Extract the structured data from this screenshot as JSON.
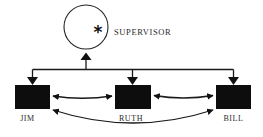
{
  "diagram": {
    "type": "organizational-communication-diagram",
    "supervisor": {
      "label": "SUPERVISOR",
      "symbol": "*",
      "shape": "circle"
    },
    "members": [
      {
        "id": "jim",
        "label": "JIM",
        "shape": "filled-square"
      },
      {
        "id": "ruth",
        "label": "RUTH",
        "shape": "filled-square"
      },
      {
        "id": "bill",
        "label": "BILL",
        "shape": "filled-square"
      }
    ],
    "connections": [
      {
        "from": "members",
        "to": "supervisor",
        "type": "single-arrow-up"
      },
      {
        "from": "supervisor",
        "to": "jim",
        "type": "single-arrow-down"
      },
      {
        "from": "supervisor",
        "to": "ruth",
        "type": "single-arrow-down"
      },
      {
        "from": "supervisor",
        "to": "bill",
        "type": "single-arrow-down"
      },
      {
        "from": "jim",
        "to": "ruth",
        "type": "bidirectional-curve"
      },
      {
        "from": "ruth",
        "to": "bill",
        "type": "bidirectional-curve"
      },
      {
        "from": "jim",
        "to": "bill",
        "type": "bidirectional-curve"
      }
    ],
    "colors": {
      "background": "#ffffff",
      "ink": "#111111"
    }
  }
}
